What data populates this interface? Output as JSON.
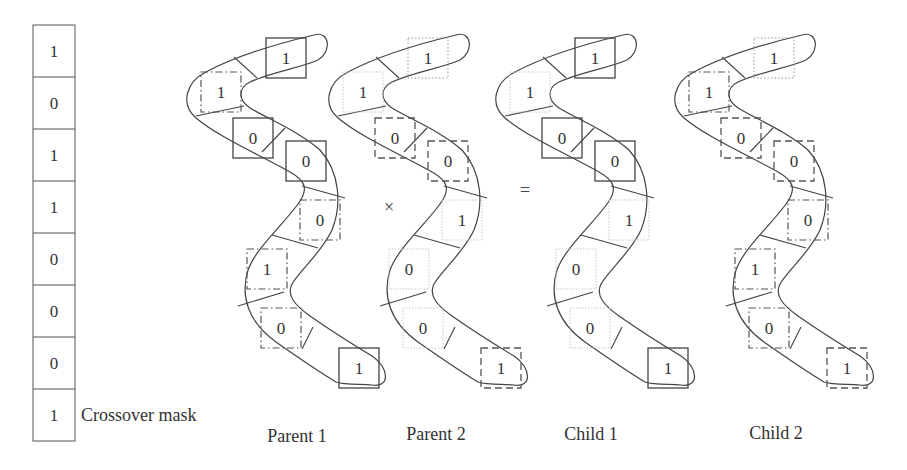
{
  "colors": {
    "stroke": "#444444",
    "light_stroke": "#bbbbbb",
    "text": "#333333",
    "background": "#ffffff"
  },
  "mask": {
    "label": "Crossover mask",
    "bits": [
      "1",
      "0",
      "1",
      "1",
      "0",
      "0",
      "0",
      "1"
    ]
  },
  "operators": {
    "multiply": "×",
    "equals": "="
  },
  "chromosomes": [
    {
      "id": "parent1",
      "label": "Parent 1",
      "offset_x": 0,
      "genes": [
        {
          "value": "1",
          "style": "solid"
        },
        {
          "value": "1",
          "style": "dashdot"
        },
        {
          "value": "0",
          "style": "solid"
        },
        {
          "value": "0",
          "style": "solid"
        },
        {
          "value": "0",
          "style": "dashdot"
        },
        {
          "value": "1",
          "style": "dashdot"
        },
        {
          "value": "0",
          "style": "dashdot"
        },
        {
          "value": "1",
          "style": "solid"
        }
      ]
    },
    {
      "id": "parent2",
      "label": "Parent 2",
      "offset_x": 142,
      "genes": [
        {
          "value": "1",
          "style": "dotted"
        },
        {
          "value": "1",
          "style": "light"
        },
        {
          "value": "0",
          "style": "dashed"
        },
        {
          "value": "0",
          "style": "dashed"
        },
        {
          "value": "1",
          "style": "light"
        },
        {
          "value": "0",
          "style": "light"
        },
        {
          "value": "0",
          "style": "light"
        },
        {
          "value": "1",
          "style": "dashed"
        }
      ]
    },
    {
      "id": "child1",
      "label": "Child 1",
      "offset_x": 309,
      "genes": [
        {
          "value": "1",
          "style": "solid"
        },
        {
          "value": "1",
          "style": "light"
        },
        {
          "value": "0",
          "style": "solid"
        },
        {
          "value": "0",
          "style": "solid"
        },
        {
          "value": "1",
          "style": "light"
        },
        {
          "value": "0",
          "style": "light"
        },
        {
          "value": "0",
          "style": "light"
        },
        {
          "value": "1",
          "style": "solid"
        }
      ]
    },
    {
      "id": "child2",
      "label": "Child 2",
      "offset_x": 488,
      "genes": [
        {
          "value": "1",
          "style": "dotted"
        },
        {
          "value": "1",
          "style": "dashdot"
        },
        {
          "value": "0",
          "style": "dashed"
        },
        {
          "value": "0",
          "style": "dashed"
        },
        {
          "value": "0",
          "style": "dashdot"
        },
        {
          "value": "1",
          "style": "dashdot"
        },
        {
          "value": "0",
          "style": "dashdot"
        },
        {
          "value": "1",
          "style": "dashed"
        }
      ]
    }
  ]
}
